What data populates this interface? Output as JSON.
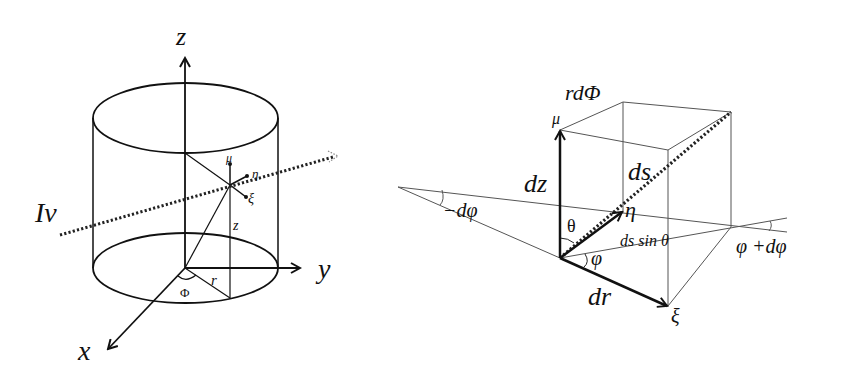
{
  "left_figure": {
    "axes": {
      "z": "z",
      "y": "y",
      "x": "x"
    },
    "ray_label": "Iν",
    "local_axes": {
      "mu": "μ",
      "eta": "η",
      "xi": "ξ"
    },
    "height_label": "z",
    "radius_label": "r",
    "angle_label": "Φ"
  },
  "right_figure": {
    "top_label": "rdΦ",
    "mu_label": "μ",
    "dz_label": "dz",
    "ds_label": "ds",
    "eta_label": "η",
    "theta_label": "θ",
    "ds_sin_label": "ds sin θ",
    "phi_label": "φ",
    "minus_dphi_label": "−dφ",
    "phi_plus_dphi_label": "φ +dφ",
    "dr_label": "dr",
    "xi_label": "ξ"
  },
  "colors": {
    "ink": "#111111",
    "thin": "#555555",
    "background": "#ffffff"
  }
}
